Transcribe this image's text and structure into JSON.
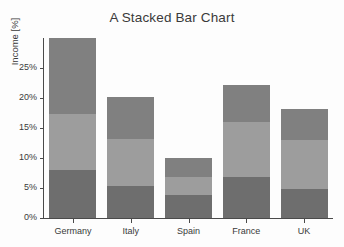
{
  "chart_data": {
    "type": "bar",
    "stacked": true,
    "title": "A Stacked Bar Chart",
    "xlabel": "",
    "ylabel": "Income [%]",
    "categories": [
      "Germany",
      "Italy",
      "Spain",
      "France",
      "UK"
    ],
    "ylim": [
      0,
      30
    ],
    "ytick_values": [
      0,
      5,
      10,
      15,
      20,
      25
    ],
    "ytick_labels": [
      "0%",
      "5%",
      "10%",
      "15%",
      "20%",
      "25%"
    ],
    "grid": false,
    "legend": "none",
    "series": [
      {
        "name": "series-1-bottom",
        "color": "#6e6e6e",
        "values": [
          8.0,
          5.3,
          3.9,
          6.8,
          4.8
        ]
      },
      {
        "name": "series-2-middle",
        "color": "#9d9d9d",
        "values": [
          9.4,
          7.8,
          2.9,
          9.2,
          8.2
        ]
      },
      {
        "name": "series-3-top",
        "color": "#808080",
        "values": [
          12.6,
          7.0,
          3.2,
          6.2,
          5.2
        ]
      }
    ],
    "totals": [
      30.0,
      20.1,
      10.0,
      22.2,
      18.2
    ]
  },
  "colors": {
    "axis": "#4a4a4a",
    "text": "#3a3a3a",
    "background": "#fdfdfd",
    "series_bottom": "#6e6e6e",
    "series_middle": "#9d9d9d",
    "series_top": "#808080"
  }
}
